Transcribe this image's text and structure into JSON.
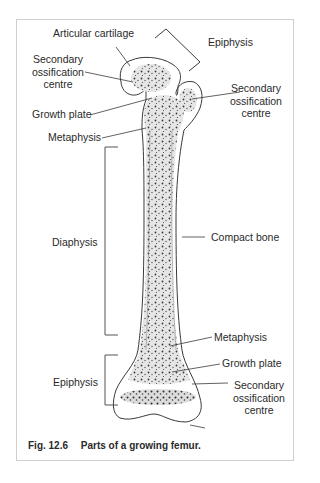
{
  "figure": {
    "caption_number": "Fig. 12.6",
    "caption_text": "Parts of a growing femur.",
    "labels": {
      "articular_cartilage": "Articular cartilage",
      "epiphysis_top": "Epiphysis",
      "secondary_ossification_left_1": "Secondary",
      "secondary_ossification_left_2": "ossification",
      "secondary_ossification_left_3": "centre",
      "secondary_ossification_right_1": "Secondary",
      "secondary_ossification_right_2": "ossification",
      "secondary_ossification_right_3": "centre",
      "growth_plate_top": "Growth plate",
      "metaphysis_top": "Metaphysis",
      "diaphysis": "Diaphysis",
      "compact_bone": "Compact bone",
      "metaphysis_bottom": "Metaphysis",
      "growth_plate_bottom": "Growth plate",
      "epiphysis_bottom": "Epiphysis",
      "secondary_ossification_bottom_1": "Secondary",
      "secondary_ossification_bottom_2": "ossification",
      "secondary_ossification_bottom_3": "centre"
    },
    "colors": {
      "line": "#3a3a3a",
      "bone_fill": "#e4e4e4",
      "stipple": "#3c3c3c",
      "frame_border": "#cfcfcf"
    }
  }
}
